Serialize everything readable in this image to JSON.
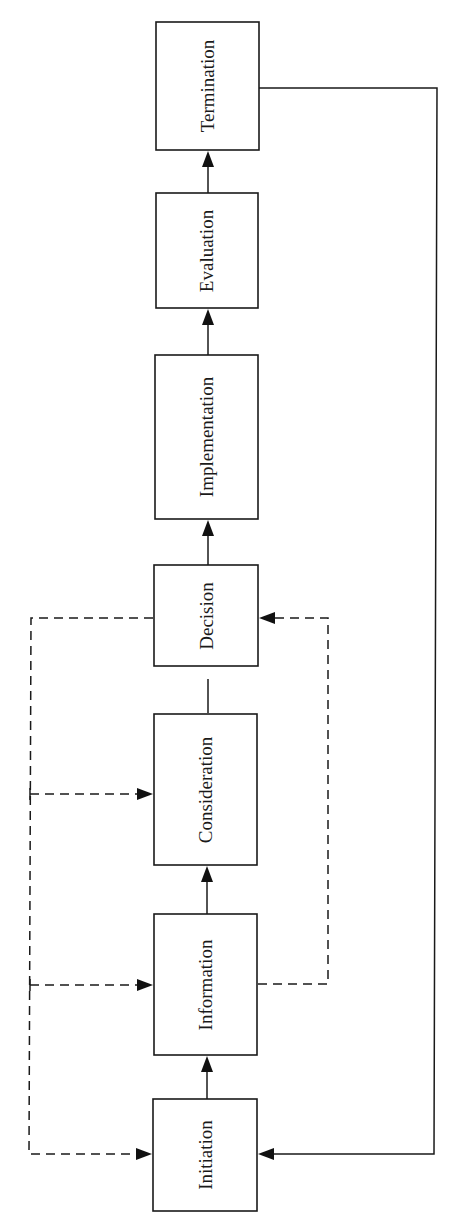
{
  "diagram": {
    "type": "flowchart",
    "orientation": "bottom-to-top, labels rotated 90deg",
    "stages": [
      {
        "id": "initiation",
        "label": "Initiation"
      },
      {
        "id": "information",
        "label": "Information"
      },
      {
        "id": "consideration",
        "label": "Consideration"
      },
      {
        "id": "decision",
        "label": "Decision"
      },
      {
        "id": "implementation",
        "label": "Implementation"
      },
      {
        "id": "evaluation",
        "label": "Evaluation"
      },
      {
        "id": "termination",
        "label": "Termination"
      }
    ],
    "edges": [
      {
        "from": "initiation",
        "to": "information",
        "style": "solid",
        "arrow": true
      },
      {
        "from": "information",
        "to": "consideration",
        "style": "solid",
        "arrow": true
      },
      {
        "from": "consideration",
        "to": "decision",
        "style": "solid",
        "arrow": false
      },
      {
        "from": "decision",
        "to": "implementation",
        "style": "solid",
        "arrow": true
      },
      {
        "from": "implementation",
        "to": "evaluation",
        "style": "solid",
        "arrow": true
      },
      {
        "from": "evaluation",
        "to": "termination",
        "style": "solid",
        "arrow": true
      },
      {
        "from": "termination",
        "to": "initiation",
        "style": "solid",
        "arrow": true,
        "route": "right side loop"
      },
      {
        "from": "decision",
        "to": "consideration",
        "style": "dashed",
        "arrow": true,
        "route": "left side feedback"
      },
      {
        "from": "decision",
        "to": "information",
        "style": "dashed",
        "arrow": true,
        "route": "left side feedback"
      },
      {
        "from": "decision",
        "to": "initiation",
        "style": "dashed",
        "arrow": true,
        "route": "left side feedback"
      },
      {
        "from": "information",
        "to": "decision",
        "style": "dashed",
        "arrow": true,
        "route": "right side feedforward"
      }
    ]
  }
}
